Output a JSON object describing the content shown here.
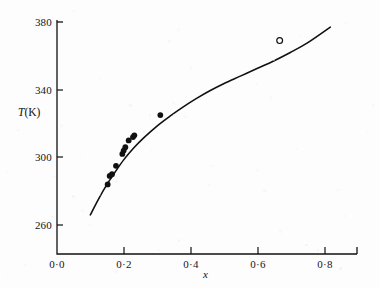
{
  "figure": {
    "background_color": "#fdfdfd",
    "ink_color": "#111111"
  },
  "axes": {
    "y_title": "T(K)",
    "y_title_italic_part": "T",
    "y_title_rest": "(K)",
    "x_title": "x",
    "y_ticks": [
      "260",
      "300",
      "340",
      "380"
    ],
    "x_ticks": [
      "0·0",
      "0·2",
      "0·4",
      "0·6",
      "0·8"
    ]
  },
  "chart_data": {
    "type": "scatter",
    "title": "",
    "subtitle": "",
    "xlabel": "x",
    "ylabel": "T(K)",
    "xlim": [
      0.0,
      0.9
    ],
    "ylim": [
      245,
      386
    ],
    "x_tick_values": [
      0.0,
      0.2,
      0.4,
      0.6,
      0.8
    ],
    "x_tick_labels": [
      "0·0",
      "0·2",
      "0·4",
      "0·6",
      "0·8"
    ],
    "y_tick_values": [
      260,
      300,
      340,
      380
    ],
    "y_tick_labels": [
      "260",
      "300",
      "340",
      "380"
    ],
    "grid": false,
    "legend": false,
    "legend_position": "none",
    "series": [
      {
        "name": "filled-data-points",
        "marker": "filled-circle",
        "color": "#111111",
        "points": [
          {
            "x": 0.152,
            "y": 284
          },
          {
            "x": 0.158,
            "y": 289
          },
          {
            "x": 0.165,
            "y": 290
          },
          {
            "x": 0.177,
            "y": 295
          },
          {
            "x": 0.196,
            "y": 302
          },
          {
            "x": 0.2,
            "y": 304
          },
          {
            "x": 0.205,
            "y": 306
          },
          {
            "x": 0.215,
            "y": 310
          },
          {
            "x": 0.228,
            "y": 312
          },
          {
            "x": 0.232,
            "y": 313
          },
          {
            "x": 0.31,
            "y": 325
          }
        ]
      },
      {
        "name": "open-data-point",
        "marker": "open-circle",
        "color": "#111111",
        "points": [
          {
            "x": 0.668,
            "y": 369
          }
        ]
      },
      {
        "name": "fitted-curve",
        "marker": "none",
        "line": "solid",
        "color": "#111111",
        "x": [
          0.1,
          0.125,
          0.15,
          0.175,
          0.2,
          0.23,
          0.26,
          0.3,
          0.34,
          0.38,
          0.42,
          0.46,
          0.5,
          0.55,
          0.6,
          0.65,
          0.7,
          0.75,
          0.82
        ],
        "y": [
          266.0,
          275.5,
          284.0,
          291.5,
          298.5,
          305.5,
          311.5,
          318.5,
          324.5,
          330.0,
          335.0,
          339.5,
          343.5,
          348.0,
          352.5,
          357.0,
          362.0,
          367.5,
          377.0
        ]
      }
    ]
  }
}
